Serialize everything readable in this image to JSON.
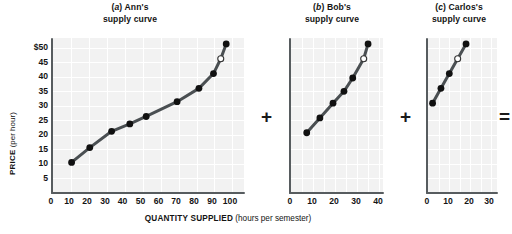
{
  "figure": {
    "y_axis_label_bold": "PRICE",
    "y_axis_label_rest": " (per hour)",
    "x_axis_label_bold": "QUANTITY SUPPLIED",
    "x_axis_label_rest": " (hours per semester)",
    "operators": [
      {
        "name": "plus-operator-1",
        "symbol": "+"
      },
      {
        "name": "plus-operator-2",
        "symbol": "+"
      },
      {
        "name": "equals-operator",
        "symbol": "="
      }
    ],
    "curve_color": "#4a4f52",
    "point_color": "#111111",
    "plot_background": "#f2f2f2",
    "axis_color": "#575c5f"
  },
  "chart_data": {
    "type": "line",
    "xlabel": "QUANTITY SUPPLIED (hours per semester)",
    "ylabel": "PRICE (per hour)",
    "grid": true,
    "legend": "none",
    "ylim": [
      0,
      52
    ],
    "yticks": [
      5,
      10,
      15,
      20,
      25,
      30,
      35,
      40,
      45,
      50
    ],
    "ytick_labels": [
      "5",
      "10",
      "15",
      "20",
      "25",
      "30",
      "35",
      "40",
      "45",
      "$50"
    ],
    "panels": [
      {
        "id": "a",
        "label": "(a) Ann's",
        "label_letter": "a",
        "label_rest": " Ann's",
        "subtitle": "supply curve",
        "xlim": [
          0,
          105
        ],
        "xticks": [
          0,
          10,
          20,
          30,
          40,
          50,
          60,
          70,
          80,
          90,
          100
        ],
        "xtick_labels": [
          "0",
          "10",
          "20",
          "30",
          "40",
          "50",
          "60",
          "70",
          "80",
          "90",
          "100"
        ],
        "x": [
          10,
          20,
          32,
          42,
          51,
          68,
          80,
          88,
          92,
          95
        ],
        "y": [
          10,
          15,
          20.5,
          23,
          25.5,
          30.5,
          35,
          40,
          45,
          50
        ],
        "open_point_index": 8,
        "open_point": {
          "x": 92,
          "y": 45
        }
      },
      {
        "id": "b",
        "label": "(b) Bob's",
        "label_letter": "b",
        "label_rest": " Bob's",
        "subtitle": "supply curve",
        "xlim": [
          0,
          42
        ],
        "xticks": [
          0,
          10,
          20,
          30,
          40
        ],
        "xtick_labels": [
          "0",
          "10",
          "20",
          "30",
          "40"
        ],
        "x": [
          7,
          13,
          19,
          24,
          28,
          33,
          35
        ],
        "y": [
          20,
          25,
          30,
          34,
          38.5,
          45,
          50
        ],
        "open_point_index": 5,
        "open_point": {
          "x": 33,
          "y": 45
        }
      },
      {
        "id": "c",
        "label": "(c) Carlos's",
        "label_letter": "c",
        "label_rest": " Carlos's",
        "subtitle": "supply curve",
        "xlim": [
          0,
          33
        ],
        "xticks": [
          0,
          10,
          20,
          30
        ],
        "xtick_labels": [
          "0",
          "10",
          "20",
          "30"
        ],
        "x": [
          2,
          6,
          10,
          14,
          18
        ],
        "y": [
          30,
          35,
          40,
          45,
          50
        ],
        "open_point_index": 3,
        "open_point": {
          "x": 14,
          "y": 45
        }
      }
    ]
  }
}
